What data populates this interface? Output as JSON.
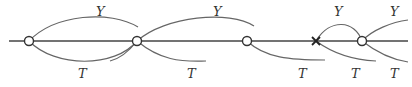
{
  "diagram": {
    "type": "timeline-arcs",
    "axis": {
      "x1": 9,
      "x2": 408,
      "y": 41
    },
    "nodes": [
      {
        "id": "n1",
        "kind": "circle",
        "x": 29
      },
      {
        "id": "n2",
        "kind": "circle",
        "x": 137
      },
      {
        "id": "n3",
        "kind": "circle",
        "x": 247
      },
      {
        "id": "x1",
        "kind": "cross",
        "x": 316
      },
      {
        "id": "n4",
        "kind": "circle",
        "x": 362
      }
    ],
    "labels": [
      {
        "text": "Y",
        "x": 96,
        "y": 16
      },
      {
        "text": "T",
        "x": 82,
        "y": 78
      },
      {
        "text": "Y",
        "x": 215,
        "y": 16
      },
      {
        "text": "T",
        "x": 191,
        "y": 78
      },
      {
        "text": "Y",
        "x": 339,
        "y": 16
      },
      {
        "text": "T",
        "x": 302,
        "y": 78
      },
      {
        "text": "Y",
        "x": 395,
        "y": 16
      },
      {
        "text": "T",
        "x": 355,
        "y": 78
      },
      {
        "text": "T",
        "x": 395,
        "y": 78
      }
    ]
  }
}
